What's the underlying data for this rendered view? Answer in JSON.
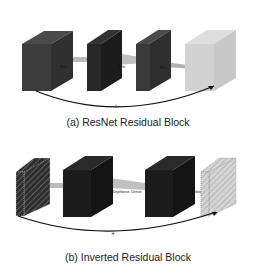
{
  "panel_a": {
    "caption": "(a) ResNet Residual Block",
    "layer_labels": [
      "Relu",
      "Relu",
      "Relu"
    ],
    "skip_symbol": "+",
    "colors": {
      "block_dark": "#3a3a3a",
      "block_darker": "#262626",
      "block_light": "#cfcfcf",
      "connector": "#a9a9a9"
    }
  },
  "panel_b": {
    "caption": "(b) Inverted Residual Block",
    "layer_labels": [
      "Conv",
      "Depthwise, Dense",
      "Conv"
    ],
    "skip_symbol": "+",
    "colors": {
      "block_dark": "#1c1c1c",
      "hatched_dark": "#2a2a2a",
      "hatched_light": "#c8c8c8",
      "connector": "#a9a9a9"
    }
  }
}
